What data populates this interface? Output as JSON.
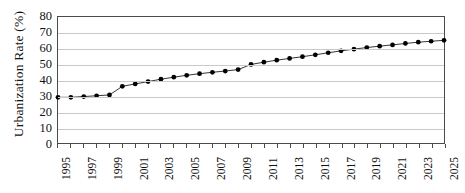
{
  "chart_data": {
    "type": "line",
    "title": "",
    "subtitle": "",
    "xlabel": "",
    "ylabel": "Urbanization Rate (%)",
    "xlim": [
      1995,
      2025
    ],
    "ylim": [
      0,
      80
    ],
    "y_ticks": [
      0,
      10,
      20,
      30,
      40,
      50,
      60,
      70,
      80
    ],
    "x_ticks": [
      1995,
      1996,
      1997,
      1998,
      1999,
      2000,
      2001,
      2002,
      2003,
      2004,
      2005,
      2006,
      2007,
      2008,
      2009,
      2010,
      2011,
      2012,
      2013,
      2014,
      2015,
      2016,
      2017,
      2018,
      2019,
      2020,
      2021,
      2022,
      2023,
      2024,
      2025
    ],
    "x_tick_labels": [
      "1995",
      "",
      "1997",
      "",
      "1999",
      "",
      "2001",
      "",
      "2003",
      "",
      "2005",
      "",
      "2007",
      "",
      "2009",
      "",
      "2011",
      "",
      "2013",
      "",
      "2015",
      "",
      "2017",
      "",
      "2019",
      "",
      "2021",
      "",
      "2023",
      "",
      "2025"
    ],
    "grid": "horizontal",
    "legend": "none",
    "marker": "filled-circle",
    "series": [
      {
        "name": "Urbanization Rate",
        "color": "#000000",
        "x": [
          1995,
          1996,
          1997,
          1998,
          1999,
          2000,
          2001,
          2002,
          2003,
          2004,
          2005,
          2006,
          2007,
          2008,
          2009,
          2010,
          2011,
          2012,
          2013,
          2014,
          2015,
          2016,
          2017,
          2018,
          2019,
          2020,
          2021,
          2022,
          2023,
          2024,
          2025
        ],
        "values": [
          29.0,
          29.0,
          29.5,
          30.0,
          30.5,
          36.0,
          37.5,
          39.0,
          40.5,
          41.8,
          43.0,
          44.0,
          44.9,
          45.7,
          46.6,
          49.9,
          51.3,
          52.6,
          53.7,
          54.8,
          56.0,
          57.3,
          58.5,
          59.6,
          60.6,
          61.5,
          62.3,
          63.2,
          64.0,
          64.6,
          65.2
        ]
      }
    ]
  },
  "figure": {
    "background_color": "#ffffff",
    "axis_color": "#4a4a4a",
    "grid_color": "#c9c9c9",
    "marker_color": "#000000",
    "line_color": "#333333"
  }
}
